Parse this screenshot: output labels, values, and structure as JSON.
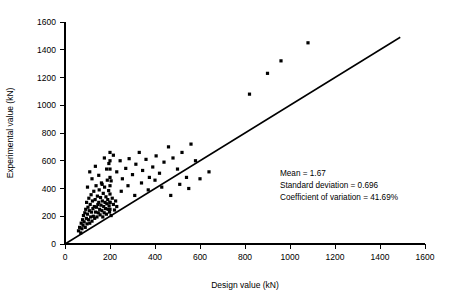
{
  "chart_data": {
    "type": "scatter",
    "title": "",
    "xlabel": "Design value (kN)",
    "ylabel": "Experimental value (kN)",
    "xlim": [
      0,
      1600
    ],
    "ylim": [
      0,
      1600
    ],
    "xticks": [
      0,
      200,
      400,
      600,
      800,
      1000,
      1200,
      1400,
      1600
    ],
    "yticks": [
      0,
      200,
      400,
      600,
      800,
      1000,
      1200,
      1400,
      1600
    ],
    "grid": false,
    "legend": "none",
    "series": [
      {
        "name": "Experimental vs design",
        "marker": "square",
        "color": "#000000",
        "points": [
          [
            60,
            95
          ],
          [
            65,
            120
          ],
          [
            70,
            80
          ],
          [
            72,
            150
          ],
          [
            75,
            110
          ],
          [
            78,
            175
          ],
          [
            80,
            135
          ],
          [
            82,
            205
          ],
          [
            85,
            160
          ],
          [
            88,
            225
          ],
          [
            90,
            120
          ],
          [
            92,
            250
          ],
          [
            95,
            185
          ],
          [
            96,
            300
          ],
          [
            98,
            145
          ],
          [
            100,
            215
          ],
          [
            102,
            265
          ],
          [
            104,
            175
          ],
          [
            106,
            330
          ],
          [
            108,
            240
          ],
          [
            110,
            150
          ],
          [
            112,
            285
          ],
          [
            114,
            195
          ],
          [
            116,
            355
          ],
          [
            118,
            230
          ],
          [
            120,
            165
          ],
          [
            122,
            310
          ],
          [
            124,
            255
          ],
          [
            126,
            200
          ],
          [
            128,
            380
          ],
          [
            130,
            270
          ],
          [
            132,
            185
          ],
          [
            134,
            320
          ],
          [
            136,
            230
          ],
          [
            138,
            420
          ],
          [
            140,
            265
          ],
          [
            142,
            195
          ],
          [
            144,
            345
          ],
          [
            146,
            285
          ],
          [
            148,
            225
          ],
          [
            150,
            300
          ],
          [
            152,
            390
          ],
          [
            154,
            250
          ],
          [
            156,
            210
          ],
          [
            158,
            335
          ],
          [
            160,
            280
          ],
          [
            162,
            440
          ],
          [
            164,
            240
          ],
          [
            166,
            310
          ],
          [
            168,
            195
          ],
          [
            170,
            365
          ],
          [
            172,
            270
          ],
          [
            174,
            225
          ],
          [
            176,
            410
          ],
          [
            178,
            300
          ],
          [
            180,
            255
          ],
          [
            182,
            340
          ],
          [
            184,
            215
          ],
          [
            186,
            290
          ],
          [
            188,
            460
          ],
          [
            190,
            320
          ],
          [
            192,
            250
          ],
          [
            194,
            385
          ],
          [
            196,
            275
          ],
          [
            198,
            230
          ],
          [
            200,
            300
          ],
          [
            200,
            360
          ],
          [
            200,
            420
          ],
          [
            200,
            480
          ],
          [
            200,
            540
          ],
          [
            200,
            600
          ],
          [
            200,
            660
          ],
          [
            200,
            300
          ],
          [
            200,
            250
          ],
          [
            205,
            205
          ],
          [
            210,
            330
          ],
          [
            215,
            285
          ],
          [
            220,
            245
          ],
          [
            225,
            310
          ],
          [
            230,
            270
          ],
          [
            100,
            410
          ],
          [
            110,
            520
          ],
          [
            120,
            470
          ],
          [
            135,
            560
          ],
          [
            150,
            495
          ],
          [
            165,
            430
          ],
          [
            175,
            620
          ],
          [
            185,
            540
          ],
          [
            195,
            580
          ],
          [
            205,
            455
          ],
          [
            215,
            640
          ],
          [
            230,
            520
          ],
          [
            245,
            600
          ],
          [
            255,
            470
          ],
          [
            270,
            545
          ],
          [
            285,
            615
          ],
          [
            300,
            500
          ],
          [
            315,
            575
          ],
          [
            330,
            660
          ],
          [
            345,
            530
          ],
          [
            360,
            610
          ],
          [
            375,
            480
          ],
          [
            390,
            555
          ],
          [
            405,
            635
          ],
          [
            420,
            510
          ],
          [
            440,
            590
          ],
          [
            460,
            700
          ],
          [
            480,
            620
          ],
          [
            500,
            540
          ],
          [
            520,
            660
          ],
          [
            540,
            480
          ],
          [
            560,
            720
          ],
          [
            580,
            600
          ],
          [
            250,
            380
          ],
          [
            280,
            420
          ],
          [
            310,
            350
          ],
          [
            340,
            440
          ],
          [
            370,
            390
          ],
          [
            400,
            460
          ],
          [
            430,
            410
          ],
          [
            470,
            350
          ],
          [
            510,
            430
          ],
          [
            550,
            400
          ],
          [
            600,
            470
          ],
          [
            640,
            520
          ],
          [
            820,
            1080
          ],
          [
            900,
            1230
          ],
          [
            960,
            1320
          ],
          [
            1080,
            1450
          ]
        ]
      }
    ],
    "reference_line": {
      "name": "equality-line",
      "from": [
        0,
        0
      ],
      "to": [
        1490,
        1490
      ],
      "color": "#000000"
    },
    "annotations": [
      {
        "id": "mean",
        "text": "Mean = 1.67"
      },
      {
        "id": "std-dev",
        "text": "Standard deviation = 0.696"
      },
      {
        "id": "cov",
        "text": "Coefficient of variation = 41.69%"
      }
    ]
  }
}
